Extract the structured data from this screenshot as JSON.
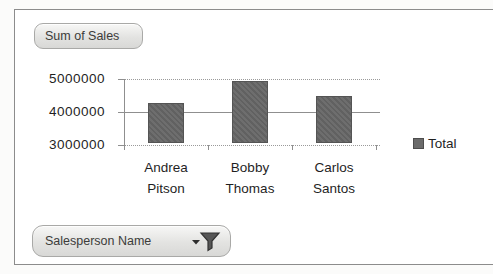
{
  "chart_data": {
    "type": "bar",
    "title": "",
    "xlabel": "",
    "ylabel": "",
    "categories": [
      "Andrea Pitson",
      "Bobby Thomas",
      "Carlos Santos"
    ],
    "series": [
      {
        "name": "Total",
        "values": [
          4200000,
          4880000,
          4420000
        ]
      }
    ],
    "ylim": [
      3000000,
      5000000
    ],
    "yticks": [
      5000000,
      4000000,
      3000000
    ],
    "ytick_labels": [
      "5000000",
      "4000000",
      "3000000"
    ],
    "grid": true,
    "legend_position": "right",
    "bar_color": "#6b6b6b"
  },
  "field_buttons": {
    "values_label": "Sum of Sales",
    "axis_label": "Salesperson Name"
  },
  "icons": {
    "filter_icon": "funnel-with-dropdown-caret"
  },
  "colors": {
    "bar": "#6b6b6b",
    "gridline": "#9a9a9a",
    "axis_line": "#8f8f8f",
    "frame_border": "#8c8c8c",
    "text": "#1f1f1f",
    "button_face": "#e3e3e1",
    "button_border": "#a9a9a7"
  }
}
